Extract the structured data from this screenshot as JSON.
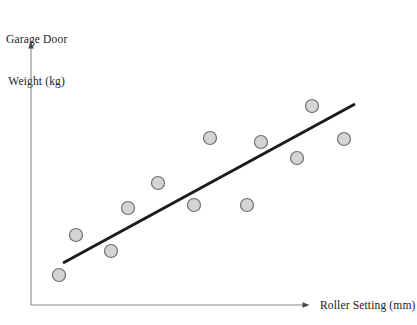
{
  "figure": {
    "kind": "scatter-plot-with-trend-line",
    "background_color": "#ffffff"
  },
  "labels": {
    "y_axis_line1": "Garage Door",
    "y_axis_line2": "Weight (kg)",
    "x_axis": "Roller Setting (mm)"
  },
  "colors": {
    "axis": "#8a8a8a",
    "marker_fill": "#d4d4d4",
    "marker_stroke": "#6f6f6f",
    "trend_line": "#1c1c1c",
    "text": "#1a1a1a"
  },
  "chart_data": {
    "type": "scatter",
    "title": "",
    "xlabel": "Roller Setting (mm)",
    "ylabel": "Garage Door Weight (kg)",
    "xlim": [
      0,
      100
    ],
    "ylim": [
      0,
      100
    ],
    "grid": false,
    "legend": "none",
    "axis_ticks": "none",
    "marker": {
      "shape": "circle",
      "radius_px": 6.5,
      "fill": "#d4d4d4",
      "stroke": "#6f6f6f",
      "stroke_width_px": 1.2
    },
    "points": [
      {
        "x": 8.8,
        "y": 11.4,
        "px": 59,
        "py": 275
      },
      {
        "x": 14.0,
        "y": 26.5,
        "px": 76,
        "py": 235
      },
      {
        "x": 25.0,
        "y": 20.5,
        "px": 111,
        "py": 251
      },
      {
        "x": 30.3,
        "y": 36.8,
        "px": 128,
        "py": 208
      },
      {
        "x": 39.7,
        "y": 46.2,
        "px": 158,
        "py": 183
      },
      {
        "x": 51.0,
        "y": 37.9,
        "px": 194,
        "py": 205
      },
      {
        "x": 56.0,
        "y": 63.3,
        "px": 210,
        "py": 138
      },
      {
        "x": 67.6,
        "y": 37.9,
        "px": 247,
        "py": 205
      },
      {
        "x": 72.0,
        "y": 61.7,
        "px": 261,
        "py": 142
      },
      {
        "x": 83.3,
        "y": 55.7,
        "px": 297,
        "py": 158
      },
      {
        "x": 88.0,
        "y": 75.4,
        "px": 312,
        "py": 106
      },
      {
        "x": 98.0,
        "y": 62.9,
        "px": 344,
        "py": 139
      }
    ],
    "trend_line": {
      "label": "line of best fit",
      "color": "#1c1c1c",
      "width_px": 3,
      "start": {
        "x": 10.1,
        "y": 15.9,
        "px": 63,
        "py": 263
      },
      "end": {
        "x": 100.0,
        "y": 76.1,
        "px": 355,
        "py": 104
      }
    },
    "axes": {
      "origin_px": {
        "x": 31,
        "y": 305
      },
      "y_axis_top_px": 41,
      "x_axis_right_px": 312,
      "arrowheads": [
        "y-axis-top",
        "x-axis-right"
      ]
    }
  }
}
